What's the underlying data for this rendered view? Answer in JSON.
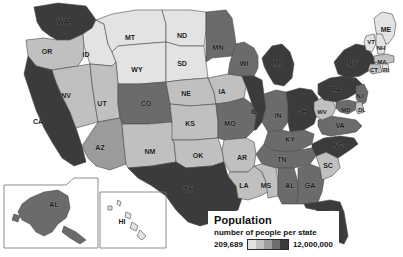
{
  "legend": {
    "title": "Population",
    "subtitle": "number of people per state",
    "min_label": "209,689",
    "max_label": "12,000,000",
    "ramp_colors": [
      "#e2e2e2",
      "#c2c2c2",
      "#9d9d9d",
      "#6f6f6f",
      "#3a3a3a"
    ]
  },
  "palette": {
    "t1": "#e3e3e3",
    "t2": "#c0c0c0",
    "t3": "#9b9b9b",
    "t4": "#6b6b6b",
    "t5": "#3b3b3b",
    "border": "#4a4a4a",
    "background": "#ffffff"
  },
  "chart_data": {
    "type": "choropleth",
    "title": "Population",
    "subtitle": "number of people per state",
    "unit": "number of people per state",
    "value_range": [
      209689,
      12000000
    ],
    "min_label": "209,689",
    "max_label": "12,000,000",
    "legend_position": "bottom-center",
    "insets": [
      "AL",
      "HI"
    ],
    "categories": [
      "WA",
      "OR",
      "CA",
      "NV",
      "ID",
      "MT",
      "WY",
      "UT",
      "CO",
      "AZ",
      "NM",
      "ND",
      "SD",
      "NE",
      "KS",
      "OK",
      "TX",
      "MN",
      "IA",
      "MO",
      "AR",
      "LA",
      "WI",
      "IL",
      "MI",
      "IN",
      "OH",
      "KY",
      "TN",
      "MS",
      "AL",
      "GA",
      "FL",
      "SC",
      "NC",
      "VA",
      "WV",
      "PA",
      "NY",
      "ME",
      "VT",
      "NH",
      "MA",
      "CT",
      "RI",
      "NJ",
      "DL",
      "MD",
      "AL-inset",
      "HI"
    ],
    "series": [
      {
        "name": "population tier",
        "values": [
          4,
          2,
          5,
          2,
          1,
          1,
          1,
          2,
          3,
          2,
          2,
          1,
          1,
          2,
          2,
          2,
          5,
          3,
          2,
          3,
          2,
          2,
          3,
          4,
          4,
          3,
          4,
          3,
          3,
          2,
          3,
          3,
          4,
          2,
          4,
          3,
          1,
          4,
          5,
          1,
          1,
          1,
          2,
          2,
          1,
          3,
          1,
          3,
          3,
          1
        ]
      }
    ],
    "state_labels": [
      {
        "code": "WA",
        "tier": 4
      },
      {
        "code": "OR",
        "tier": 2
      },
      {
        "code": "CA",
        "tier": 5
      },
      {
        "code": "NV",
        "tier": 2
      },
      {
        "code": "ID",
        "tier": 1
      },
      {
        "code": "MT",
        "tier": 1
      },
      {
        "code": "WY",
        "tier": 1
      },
      {
        "code": "UT",
        "tier": 2
      },
      {
        "code": "CO",
        "tier": 3
      },
      {
        "code": "AZ",
        "tier": 2
      },
      {
        "code": "NM",
        "tier": 2
      },
      {
        "code": "ND",
        "tier": 1
      },
      {
        "code": "SD",
        "tier": 1
      },
      {
        "code": "NE",
        "tier": 2
      },
      {
        "code": "KS",
        "tier": 2
      },
      {
        "code": "OK",
        "tier": 2
      },
      {
        "code": "TX",
        "tier": 5
      },
      {
        "code": "MN",
        "tier": 3
      },
      {
        "code": "IA",
        "tier": 2
      },
      {
        "code": "MO",
        "tier": 3
      },
      {
        "code": "AR",
        "tier": 2
      },
      {
        "code": "LA",
        "tier": 2
      },
      {
        "code": "WI",
        "tier": 3
      },
      {
        "code": "IL",
        "tier": 4
      },
      {
        "code": "MI",
        "tier": 4
      },
      {
        "code": "IN",
        "tier": 3
      },
      {
        "code": "OH",
        "tier": 4
      },
      {
        "code": "KY",
        "tier": 3
      },
      {
        "code": "TN",
        "tier": 3
      },
      {
        "code": "MS",
        "tier": 2
      },
      {
        "code": "AL",
        "tier": 3
      },
      {
        "code": "GA",
        "tier": 3
      },
      {
        "code": "FL",
        "tier": 4
      },
      {
        "code": "SC",
        "tier": 2
      },
      {
        "code": "NC",
        "tier": 4
      },
      {
        "code": "VA",
        "tier": 3
      },
      {
        "code": "WV",
        "tier": 1
      },
      {
        "code": "PA",
        "tier": 4
      },
      {
        "code": "NY",
        "tier": 5
      },
      {
        "code": "ME",
        "tier": 1
      },
      {
        "code": "VT",
        "tier": 1
      },
      {
        "code": "NH",
        "tier": 1
      },
      {
        "code": "MA",
        "tier": 2
      },
      {
        "code": "CT",
        "tier": 2
      },
      {
        "code": "RI",
        "tier": 1
      },
      {
        "code": "NJ",
        "tier": 3
      },
      {
        "code": "DL",
        "tier": 1
      },
      {
        "code": "MD",
        "tier": 3
      },
      {
        "code": "HI",
        "tier": 1
      }
    ]
  },
  "map": {
    "states": [
      {
        "name": "washington",
        "label": "WA",
        "tier": 5,
        "lx": 63,
        "ly": 22,
        "d": "M34 7 L58 3 L86 6 L92 14 L96 20 L92 28 L83 34 L70 40 L57 40 L50 36 L42 30 L37 22 Z"
      },
      {
        "name": "oregon",
        "label": "OR",
        "tier": 2,
        "lx": 47,
        "ly": 52,
        "d": "M26 40 L44 38 L57 40 L70 40 L83 34 L84 46 L83 58 L78 66 L52 70 L36 66 L28 56 Z"
      },
      {
        "name": "california",
        "label": "CA",
        "tier": 5,
        "lx": 38,
        "ly": 122,
        "d": "M28 56 L36 66 L52 70 L56 82 L62 96 L70 112 L76 128 L82 146 L86 162 L74 166 L62 158 L52 142 L44 128 L36 110 L30 92 L24 74 Z"
      },
      {
        "name": "nevada",
        "label": "NV",
        "tier": 2,
        "lx": 66,
        "ly": 96,
        "d": "M52 70 L78 66 L90 64 L92 84 L95 104 L98 122 L76 128 L70 112 L62 96 L56 82 Z"
      },
      {
        "name": "idaho",
        "label": "ID",
        "tier": 1,
        "lx": 86,
        "ly": 55,
        "d": "M83 34 L92 28 L96 20 L104 24 L106 34 L108 44 L112 52 L116 62 L112 66 L90 64 L84 46 Z"
      },
      {
        "name": "montana",
        "label": "MT",
        "tier": 1,
        "lx": 130,
        "ly": 38,
        "d": "M96 20 L112 14 L136 10 L162 10 L166 24 L166 42 L140 44 L118 46 L112 52 L108 44 L106 34 L104 24 Z"
      },
      {
        "name": "wyoming",
        "label": "WY",
        "tier": 1,
        "lx": 137,
        "ly": 70,
        "d": "M118 46 L140 44 L166 42 L166 62 L166 82 L140 84 L118 84 L116 62 L112 52 Z"
      },
      {
        "name": "utah",
        "label": "UT",
        "tier": 2,
        "lx": 102,
        "ly": 104,
        "d": "M90 64 L112 66 L116 62 L118 84 L118 104 L120 118 L98 122 L95 104 L92 84 Z"
      },
      {
        "name": "colorado",
        "label": "CO",
        "tier": 4,
        "lx": 146,
        "ly": 104,
        "d": "M118 84 L140 84 L166 82 L170 104 L172 122 L148 124 L122 124 L120 118 L118 104 Z"
      },
      {
        "name": "arizona",
        "label": "AZ",
        "tier": 3,
        "lx": 100,
        "ly": 148,
        "d": "M98 122 L120 118 L122 124 L124 146 L126 164 L110 170 L96 166 L88 158 L82 146 L90 134 Z"
      },
      {
        "name": "new-mexico",
        "label": "NM",
        "tier": 2,
        "lx": 150,
        "ly": 152,
        "d": "M122 124 L148 124 L172 122 L174 142 L176 162 L152 166 L128 168 L126 164 L124 146 Z"
      },
      {
        "name": "north-dakota",
        "label": "ND",
        "tier": 1,
        "lx": 182,
        "ly": 36,
        "d": "M162 10 L190 10 L206 12 L206 30 L204 46 L180 46 L166 42 L166 24 Z"
      },
      {
        "name": "south-dakota",
        "label": "SD",
        "tier": 1,
        "lx": 182,
        "ly": 64,
        "d": "M166 42 L180 46 L204 46 L206 62 L208 78 L182 80 L166 82 L166 62 Z"
      },
      {
        "name": "nebraska",
        "label": "NE",
        "tier": 2,
        "lx": 186,
        "ly": 94,
        "d": "M166 82 L182 80 L208 78 L214 92 L216 104 L190 106 L170 104 L166 82 Z"
      },
      {
        "name": "kansas",
        "label": "KS",
        "tier": 2,
        "lx": 190,
        "ly": 124,
        "d": "M170 104 L190 106 L216 104 L218 122 L218 138 L194 140 L172 140 L172 122 Z"
      },
      {
        "name": "oklahoma",
        "label": "OK",
        "tier": 2,
        "lx": 198,
        "ly": 156,
        "d": "M172 140 L194 140 L218 138 L222 150 L224 162 L212 166 L186 168 L176 162 L174 142 Z"
      },
      {
        "name": "texas",
        "label": "TX",
        "tier": 5,
        "lx": 188,
        "ly": 190,
        "d": "M128 168 L152 166 L176 162 L186 168 L212 166 L224 162 L228 176 L236 186 L242 198 L238 210 L228 214 L214 222 L200 226 L188 222 L176 210 L166 196 L152 186 L138 178 Z"
      },
      {
        "name": "minnesota",
        "label": "MN",
        "tier": 4,
        "lx": 218,
        "ly": 48,
        "d": "M206 12 L226 10 L232 18 L234 30 L236 44 L232 56 L212 58 L206 62 L206 30 Z"
      },
      {
        "name": "iowa",
        "label": "IA",
        "tier": 2,
        "lx": 222,
        "ly": 92,
        "d": "M208 78 L228 74 L242 76 L246 86 L244 98 L230 102 L216 104 L214 92 Z"
      },
      {
        "name": "missouri",
        "label": "MO",
        "tier": 4,
        "lx": 230,
        "ly": 124,
        "d": "M216 104 L230 102 L244 98 L252 104 L256 116 L254 130 L246 138 L224 140 L218 138 L218 122 Z"
      },
      {
        "name": "arkansas",
        "label": "AR",
        "tier": 2,
        "lx": 242,
        "ly": 158,
        "d": "M224 140 L246 138 L254 142 L256 154 L254 166 L248 172 L230 172 L224 162 L222 150 Z"
      },
      {
        "name": "louisiana",
        "label": "LA",
        "tier": 2,
        "lx": 244,
        "ly": 186,
        "d": "M230 172 L248 172 L254 166 L262 172 L266 182 L268 192 L260 196 L248 200 L238 198 L236 186 L228 176 Z"
      },
      {
        "name": "wisconsin",
        "label": "WI",
        "tier": 4,
        "lx": 244,
        "ly": 64,
        "d": "M232 56 L236 44 L244 42 L254 48 L258 56 L258 68 L254 76 L242 76 L228 74 L230 62 Z"
      },
      {
        "name": "illinois",
        "label": "IL",
        "tier": 5,
        "lx": 254,
        "ly": 112,
        "d": "M242 76 L254 76 L262 80 L264 94 L266 108 L262 122 L256 130 L254 130 L256 116 L252 104 L246 86 Z"
      },
      {
        "name": "michigan",
        "label": "MI",
        "tier": 5,
        "lx": 278,
        "ly": 64,
        "d": "M262 58 L272 46 L282 44 L290 52 L294 64 L292 78 L284 86 L274 84 L268 74 L264 66 Z"
      },
      {
        "name": "indiana",
        "label": "IN",
        "tier": 4,
        "lx": 278,
        "ly": 116,
        "d": "M264 94 L276 90 L286 92 L288 106 L288 122 L282 130 L268 132 L262 122 L266 108 Z"
      },
      {
        "name": "ohio",
        "label": "OH",
        "tier": 5,
        "lx": 302,
        "ly": 112,
        "d": "M286 92 L300 88 L312 90 L318 98 L318 112 L314 124 L304 130 L290 132 L288 122 L288 106 Z"
      },
      {
        "name": "kentucky",
        "label": "KY",
        "tier": 4,
        "lx": 290,
        "ly": 140,
        "d": "M268 132 L282 130 L290 132 L304 130 L314 134 L312 144 L300 150 L286 152 L272 150 L264 144 Z"
      },
      {
        "name": "tennessee",
        "label": "TN",
        "tier": 4,
        "lx": 282,
        "ly": 160,
        "d": "M264 144 L272 150 L286 152 L300 150 L312 148 L316 156 L310 164 L294 168 L276 168 L262 164 L256 154 Z"
      },
      {
        "name": "mississippi",
        "label": "MS",
        "tier": 2,
        "lx": 266,
        "ly": 186,
        "d": "M254 166 L262 164 L276 168 L278 182 L278 196 L268 198 L266 182 L262 172 Z"
      },
      {
        "name": "alabama",
        "label": "AL",
        "tier": 4,
        "lx": 290,
        "ly": 186,
        "d": "M278 182 L278 168 L294 168 L298 182 L298 196 L296 204 L282 204 L278 196 Z"
      },
      {
        "name": "georgia",
        "label": "GA",
        "tier": 4,
        "lx": 310,
        "ly": 186,
        "d": "M298 168 L310 164 L320 168 L324 180 L322 192 L318 202 L304 204 L296 204 L298 196 L298 182 Z"
      },
      {
        "name": "florida",
        "label": "FL",
        "tier": 5,
        "lx": 334,
        "ly": 214,
        "d": "M304 204 L318 202 L330 200 L340 202 L344 212 L346 224 L348 236 L344 244 L338 242 L332 230 L326 218 L316 210 L306 208 Z"
      },
      {
        "name": "south-carolina",
        "label": "SC",
        "tier": 2,
        "lx": 328,
        "ly": 166,
        "d": "M316 156 L326 152 L338 158 L340 168 L332 176 L322 180 L320 168 Z"
      },
      {
        "name": "north-carolina",
        "label": "NC",
        "tier": 5,
        "lx": 338,
        "ly": 146,
        "d": "M312 144 L324 138 L340 136 L354 138 L358 144 L350 150 L338 158 L326 152 L316 156 L312 148 Z"
      },
      {
        "name": "virginia",
        "label": "VA",
        "tier": 4,
        "lx": 340,
        "ly": 126,
        "d": "M318 120 L330 116 L344 118 L356 120 L362 126 L356 132 L344 134 L330 136 L322 134 L318 126 Z"
      },
      {
        "name": "west-virginia",
        "label": "WV",
        "tier": 2,
        "lx": 322,
        "ly": 112,
        "d": "M314 102 L322 98 L332 100 L336 108 L332 116 L322 120 L316 116 L314 110 Z"
      },
      {
        "name": "pennsylvania",
        "label": "PA",
        "tier": 5,
        "lx": 336,
        "ly": 90,
        "d": "M318 84 L330 78 L344 76 L356 78 L362 84 L358 92 L348 98 L336 102 L324 100 L318 94 Z"
      },
      {
        "name": "new-york",
        "label": "NY",
        "tier": 5,
        "lx": 352,
        "ly": 64,
        "d": "M334 62 L344 50 L356 44 L366 46 L372 54 L376 62 L370 70 L360 76 L348 78 L338 74 Z"
      },
      {
        "name": "maine",
        "label": "ME",
        "tier": 1,
        "lx": 386,
        "ly": 30,
        "d": "M374 18 L382 12 L392 14 L396 24 L394 36 L388 44 L380 42 L376 32 Z"
      },
      {
        "name": "vermont",
        "label": "VT",
        "tier": 1,
        "lx": 371,
        "ly": 42,
        "d": "M366 36 L374 34 L376 44 L372 52 L366 50 L364 42 Z"
      },
      {
        "name": "new-hampshire",
        "label": "NH",
        "tier": 1,
        "lx": 381,
        "ly": 48,
        "d": "M376 34 L382 34 L386 44 L384 54 L378 54 L376 44 Z"
      },
      {
        "name": "massachusetts",
        "label": "MA",
        "tier": 2,
        "lx": 382,
        "ly": 62,
        "d": "M374 56 L386 54 L394 56 L394 62 L384 64 L374 62 Z"
      },
      {
        "name": "connecticut",
        "label": "CT",
        "tier": 2,
        "lx": 374,
        "ly": 70,
        "d": "M370 64 L380 64 L382 72 L372 74 L368 70 Z"
      },
      {
        "name": "rhode-island",
        "label": "RI",
        "tier": 1,
        "lx": 386,
        "ly": 70,
        "d": "M382 64 L388 64 L389 72 L383 72 Z"
      },
      {
        "name": "new-jersey",
        "label": "NJ",
        "tier": 4,
        "lx": 360,
        "ly": 96,
        "d": "M356 86 L364 84 L368 92 L366 102 L360 106 L356 98 Z"
      },
      {
        "name": "delaware",
        "label": "DL",
        "tier": 2,
        "lx": 362,
        "ly": 110,
        "d": "M356 102 L362 102 L364 112 L358 114 L355 108 Z"
      },
      {
        "name": "maryland",
        "label": "MD",
        "tier": 4,
        "lx": 346,
        "ly": 110,
        "d": "M336 102 L348 100 L356 102 L355 110 L348 114 L340 112 L336 108 Z"
      }
    ],
    "insets": [
      {
        "name": "alaska",
        "label": "AL",
        "tier": 4,
        "lx": 54,
        "ly": 205,
        "box": "M4 185 L66 185 L74 178 L98 178 L98 248 L4 248 Z",
        "d": "M30 198 L44 192 L58 190 L68 196 L70 208 L66 218 L58 224 L52 232 L44 236 L36 232 L30 224 L22 220 L18 212 L22 204 Z M14 214 L20 216 L18 222 L12 220 Z M64 226 L76 232 L86 240 L80 244 L70 238 L62 232 Z"
      },
      {
        "name": "hawaii",
        "label": "HI",
        "tier": 1,
        "lx": 122,
        "ly": 222,
        "box": "M100 192 L166 192 L166 248 L100 248 Z",
        "d": "M108 206 L112 206 L112 210 L108 210 Z M118 200 L121 202 L120 206 L117 204 Z M126 212 L131 214 L130 219 L125 217 Z M132 222 L138 226 L136 231 L130 228 Z M140 230 L146 236 L142 240 L137 236 Z"
      }
    ]
  }
}
